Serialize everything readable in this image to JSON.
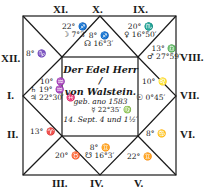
{
  "chart": {
    "title_line1": "Der Edel Herr /",
    "title_line2": "von Walstein.",
    "born_line": "geb. ano 1583",
    "mercury_center": "☿ 22°35′ ♍",
    "date_line": "14. Sept. 4 und 1½′"
  },
  "houses": {
    "I": {
      "label": "I.",
      "cusp": "10° ♒",
      "planets": [
        "♄ 19° ♒",
        "♃ 22°30′ ♓"
      ]
    },
    "II": {
      "label": "II.",
      "cusp": "13° ♈",
      "planets": []
    },
    "III": {
      "label": "III.",
      "cusp": "20° ♉",
      "planets": []
    },
    "IV": {
      "label": "IV.",
      "cusp": "8° ♊",
      "planets": [
        "☋ 16°3′"
      ]
    },
    "V": {
      "label": "V.",
      "cusp": "22° ♊",
      "planets": []
    },
    "VI": {
      "label": "VI.",
      "cusp": "8° ♋",
      "planets": []
    },
    "VII": {
      "label": "VII.",
      "cusp": "10° ♌",
      "planets": [
        "☉ 0°45′"
      ]
    },
    "VIII": {
      "label": "VIII.",
      "cusp": "13° ♎",
      "planets": [
        "♂ 27°59′"
      ]
    },
    "IX": {
      "label": "IX.",
      "cusp": "20° ♏",
      "planets": [
        "♀ 16°50′"
      ]
    },
    "X": {
      "label": "X.",
      "cusp": "8° ♐",
      "planets": [
        "☊ 16°3′"
      ]
    },
    "XI": {
      "label": "XI.",
      "cusp": "22° ♐",
      "planets": [
        "☽ 7°3′"
      ]
    },
    "XII": {
      "label": "XII.",
      "cusp": "8° ♑",
      "planets": []
    }
  },
  "colors": {
    "ink": "#1a1a1a",
    "paper": "#ffffff"
  }
}
